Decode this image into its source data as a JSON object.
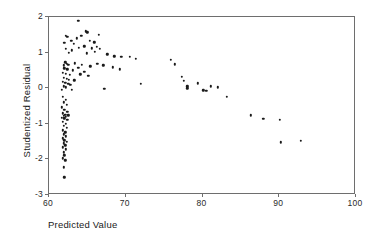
{
  "chart_data": {
    "type": "scatter",
    "title": "",
    "xlabel": "Predicted Value",
    "ylabel": "Studentized Residual",
    "xlim": [
      60,
      100
    ],
    "ylim": [
      -3,
      2
    ],
    "xticks": [
      60,
      70,
      80,
      90,
      100
    ],
    "yticks": [
      2,
      1,
      0,
      -1,
      -2,
      -3
    ],
    "xtick_labels": [
      "60",
      "70",
      "80",
      "90",
      "100"
    ],
    "ytick_labels": [
      "2",
      "1",
      "0",
      "-1",
      "-2",
      "-3"
    ],
    "grid": false,
    "legend": null,
    "marker": "filled-circle",
    "marker_color": "#1a1a1a",
    "frame_color": "#6e6e6e",
    "background_color": "#ffffff",
    "series": [
      {
        "name": "residuals",
        "points": [
          [
            63.8,
            1.9
          ],
          [
            62.2,
            1.47
          ],
          [
            62.4,
            1.44
          ],
          [
            64.8,
            1.6
          ],
          [
            65.0,
            1.57
          ],
          [
            63.6,
            1.4
          ],
          [
            64.2,
            1.47
          ],
          [
            66.5,
            1.5
          ],
          [
            62.0,
            1.27
          ],
          [
            62.9,
            1.33
          ],
          [
            63.2,
            1.24
          ],
          [
            65.3,
            1.33
          ],
          [
            65.9,
            1.29
          ],
          [
            62.2,
            1.1
          ],
          [
            63.0,
            1.06
          ],
          [
            63.9,
            1.14
          ],
          [
            64.6,
            1.18
          ],
          [
            65.6,
            1.12
          ],
          [
            66.2,
            1.17
          ],
          [
            66.6,
            1.1
          ],
          [
            62.6,
            1.0
          ],
          [
            64.9,
            0.98
          ],
          [
            66.0,
            1.02
          ],
          [
            67.6,
            0.95
          ],
          [
            68.5,
            0.9
          ],
          [
            69.4,
            0.89
          ],
          [
            70.5,
            0.88
          ],
          [
            71.3,
            0.83
          ],
          [
            62.1,
            0.73
          ],
          [
            62.3,
            0.69
          ],
          [
            62.5,
            0.66
          ],
          [
            61.9,
            0.64
          ],
          [
            63.4,
            0.7
          ],
          [
            64.3,
            0.66
          ],
          [
            66.3,
            0.69
          ],
          [
            67.1,
            0.64
          ],
          [
            68.3,
            0.59
          ],
          [
            69.2,
            0.53
          ],
          [
            62.0,
            0.56
          ],
          [
            62.4,
            0.53
          ],
          [
            63.1,
            0.5
          ],
          [
            63.8,
            0.57
          ],
          [
            64.6,
            0.46
          ],
          [
            65.4,
            0.61
          ],
          [
            61.8,
            0.44
          ],
          [
            62.2,
            0.41
          ],
          [
            62.7,
            0.37
          ],
          [
            64.1,
            0.39
          ],
          [
            65.1,
            0.35
          ],
          [
            61.9,
            0.3
          ],
          [
            62.3,
            0.27
          ],
          [
            62.6,
            0.24
          ],
          [
            63.3,
            0.22
          ],
          [
            61.8,
            0.18
          ],
          [
            62.1,
            0.15
          ],
          [
            62.5,
            0.12
          ],
          [
            62.8,
            0.09
          ],
          [
            61.9,
            0.05
          ],
          [
            62.2,
            0.02
          ],
          [
            63.0,
            -0.04
          ],
          [
            61.7,
            -0.05
          ],
          [
            67.2,
            -0.02
          ],
          [
            72.0,
            0.12
          ],
          [
            75.9,
            0.8
          ],
          [
            76.4,
            0.67
          ],
          [
            77.3,
            0.32
          ],
          [
            77.6,
            0.21
          ],
          [
            78.0,
            0.05
          ],
          [
            78.0,
            0.0
          ],
          [
            79.4,
            0.14
          ],
          [
            80.1,
            -0.06
          ],
          [
            80.5,
            -0.07
          ],
          [
            81.1,
            0.05
          ],
          [
            82.0,
            0.03
          ],
          [
            83.2,
            -0.24
          ],
          [
            86.3,
            -0.76
          ],
          [
            87.9,
            -0.86
          ],
          [
            90.1,
            -0.88
          ],
          [
            90.2,
            -1.52
          ],
          [
            92.8,
            -1.48
          ],
          [
            61.8,
            -0.25
          ],
          [
            62.2,
            -0.32
          ],
          [
            61.9,
            -0.4
          ],
          [
            62.3,
            -0.47
          ],
          [
            61.7,
            -0.54
          ],
          [
            62.0,
            -0.61
          ],
          [
            62.4,
            -0.66
          ],
          [
            61.8,
            -0.7
          ],
          [
            62.1,
            -0.74
          ],
          [
            62.5,
            -0.76
          ],
          [
            61.9,
            -0.78
          ],
          [
            62.2,
            -0.8
          ],
          [
            61.7,
            -0.83
          ],
          [
            62.0,
            -0.85
          ],
          [
            62.4,
            -0.88
          ],
          [
            61.8,
            -0.94
          ],
          [
            62.2,
            -1.0
          ],
          [
            61.9,
            -1.06
          ],
          [
            62.3,
            -1.12
          ],
          [
            61.8,
            -1.18
          ],
          [
            62.1,
            -1.24
          ],
          [
            61.9,
            -1.3
          ],
          [
            62.2,
            -1.35
          ],
          [
            61.8,
            -1.41
          ],
          [
            62.0,
            -1.46
          ],
          [
            62.3,
            -1.5
          ],
          [
            61.9,
            -1.55
          ],
          [
            62.1,
            -1.6
          ],
          [
            61.8,
            -1.66
          ],
          [
            62.2,
            -1.72
          ],
          [
            61.9,
            -1.8
          ],
          [
            62.0,
            -1.88
          ],
          [
            61.8,
            -1.97
          ],
          [
            62.1,
            -2.03
          ],
          [
            61.9,
            -2.22
          ],
          [
            62.0,
            -2.5
          ]
        ]
      }
    ]
  }
}
